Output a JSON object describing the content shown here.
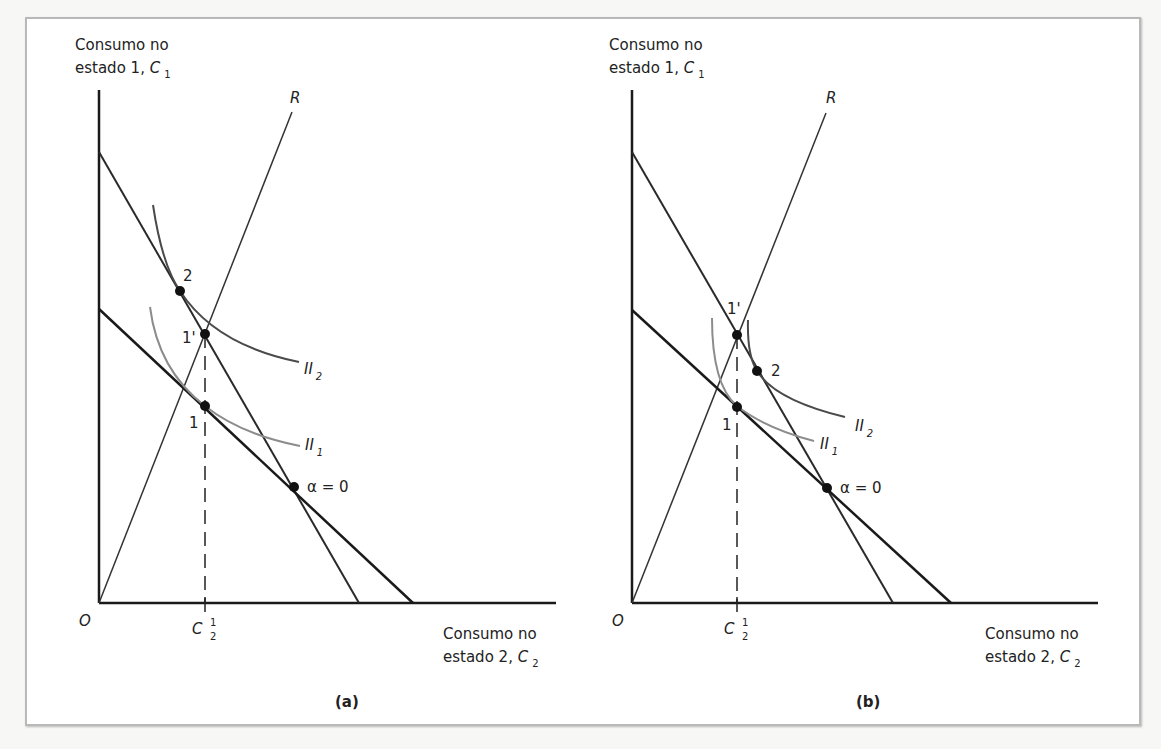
{
  "figure": {
    "panels": [
      {
        "id": "a",
        "caption": "(a)",
        "y_axis_label": {
          "line1": "Consumo no",
          "line2": "estado 1,",
          "var": "C",
          "sub": "1"
        },
        "x_axis_label": {
          "line1": "Consumo no",
          "line2": "estado 2,",
          "var": "C",
          "sub": "2"
        },
        "origin": "O",
        "ray_label": "R",
        "tick_label": {
          "var": "C",
          "sup": "1",
          "sub": "2"
        },
        "points": {
          "p2": "2",
          "p1prime": "1'",
          "p1": "1",
          "alpha": "α = 0"
        },
        "curves": {
          "ii2": {
            "name": "II",
            "sub": "2"
          },
          "ii1": {
            "name": "II",
            "sub": "1"
          }
        }
      },
      {
        "id": "b",
        "caption": "(b)",
        "y_axis_label": {
          "line1": "Consumo no",
          "line2": "estado 1,",
          "var": "C",
          "sub": "1"
        },
        "x_axis_label": {
          "line1": "Consumo no",
          "line2": "estado 2,",
          "var": "C",
          "sub": "2"
        },
        "origin": "O",
        "ray_label": "R",
        "tick_label": {
          "var": "C",
          "sup": "1",
          "sub": "2"
        },
        "points": {
          "p1prime": "1'",
          "p2": "2",
          "p1": "1",
          "alpha": "α = 0"
        },
        "curves": {
          "ii2": {
            "name": "II",
            "sub": "2"
          },
          "ii1": {
            "name": "II",
            "sub": "1"
          }
        }
      }
    ],
    "colors": {
      "axis": "#1a1a1a",
      "budget_line": "#2a2a2a",
      "indifference_ii2": "#4a4a4a",
      "indifference_ii1": "#8c8c8c",
      "ray": "#333333"
    }
  }
}
